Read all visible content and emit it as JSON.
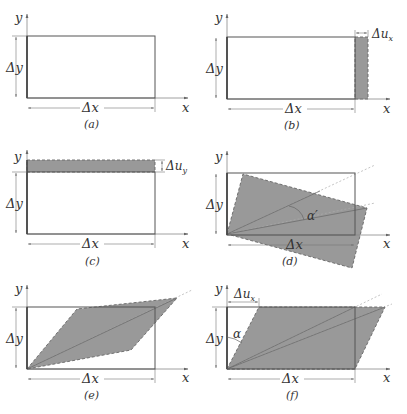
{
  "figure": {
    "panels": [
      {
        "id": "a",
        "caption": "(a)",
        "x_axis": "x",
        "y_axis": "y",
        "dim_x": "Δx",
        "dim_y": "Δy",
        "description": "undeformed element"
      },
      {
        "id": "b",
        "caption": "(b)",
        "x_axis": "x",
        "y_axis": "y",
        "dim_x": "Δx",
        "dim_y": "Δy",
        "extra_label": "Δu",
        "extra_sub": "x",
        "description": "normal strain in x"
      },
      {
        "id": "c",
        "caption": "(c)",
        "x_axis": "x",
        "y_axis": "y",
        "dim_x": "Δx",
        "dim_y": "Δy",
        "extra_label": "Δu",
        "extra_sub": "y",
        "description": "normal strain in y"
      },
      {
        "id": "d",
        "caption": "(d)",
        "x_axis": "x",
        "y_axis": "y",
        "dim_x": "Δx",
        "dim_y": "Δy",
        "angle_label": "α′",
        "description": "rigid rotation"
      },
      {
        "id": "e",
        "caption": "(e)",
        "x_axis": "x",
        "y_axis": "y",
        "dim_x": "Δx",
        "dim_y": "Δy",
        "description": "pure shear"
      },
      {
        "id": "f",
        "caption": "(f)",
        "x_axis": "x",
        "y_axis": "y",
        "dim_x": "Δx",
        "dim_y": "Δy",
        "extra_label": "Δu",
        "extra_sub": "x",
        "angle_label": "α",
        "description": "simple shear"
      }
    ],
    "colors": {
      "shade": "#999999",
      "outline": "#555555",
      "axis": "#888888"
    }
  }
}
